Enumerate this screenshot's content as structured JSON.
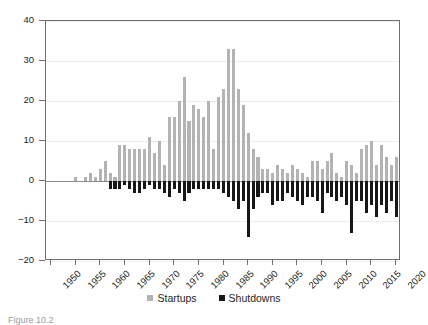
{
  "chart_data": {
    "type": "bar",
    "title": "",
    "xlabel": "",
    "ylabel": "",
    "ylim": [
      -20,
      40
    ],
    "yticks": [
      40,
      30,
      20,
      10,
      0,
      -10,
      -20
    ],
    "ytick_labels": [
      "40",
      "30",
      "20",
      "10",
      "0",
      "−10",
      "−20"
    ],
    "xlim": [
      1949,
      2021
    ],
    "xticks": [
      1950,
      1955,
      1960,
      1965,
      1970,
      1975,
      1980,
      1985,
      1990,
      1995,
      2000,
      2005,
      2010,
      2015,
      2020
    ],
    "xtick_labels": [
      "1950",
      "1955",
      "1960",
      "1965",
      "1970",
      "1975",
      "1980",
      "1985",
      "1990",
      "1995",
      "2000",
      "2005",
      "2010",
      "2015",
      "2020"
    ],
    "grid": true,
    "grid_axis": "y",
    "legend_position": "bottom-center",
    "stacked": false,
    "orientation": "vertical",
    "x": [
      1950,
      1951,
      1952,
      1953,
      1954,
      1955,
      1956,
      1957,
      1958,
      1959,
      1960,
      1961,
      1962,
      1963,
      1964,
      1965,
      1966,
      1967,
      1968,
      1969,
      1970,
      1971,
      1972,
      1973,
      1974,
      1975,
      1976,
      1977,
      1978,
      1979,
      1980,
      1981,
      1982,
      1983,
      1984,
      1985,
      1986,
      1987,
      1988,
      1989,
      1990,
      1991,
      1992,
      1993,
      1994,
      1995,
      1996,
      1997,
      1998,
      1999,
      2000,
      2001,
      2002,
      2003,
      2004,
      2005,
      2006,
      2007,
      2008,
      2009,
      2010,
      2011,
      2012,
      2013,
      2014,
      2015,
      2016,
      2017,
      2018,
      2019,
      2020
    ],
    "series": [
      {
        "name": "Startups",
        "color": "#b3b3b3",
        "values": [
          0,
          0,
          0,
          0,
          0,
          1,
          0,
          1,
          2,
          1,
          3,
          5,
          2,
          1,
          9,
          9,
          8,
          8,
          8,
          8,
          11,
          7,
          10,
          4,
          16,
          16,
          20,
          26,
          15,
          19,
          18,
          16,
          20,
          8,
          21,
          23,
          33,
          33,
          23,
          19,
          12,
          8,
          6,
          3,
          3,
          2,
          4,
          3,
          2,
          4,
          3,
          2,
          1,
          5,
          5,
          3,
          5,
          7,
          2,
          1,
          5,
          4,
          2,
          8,
          9,
          10,
          4,
          9,
          6,
          4,
          6
        ]
      },
      {
        "name": "Shutdowns",
        "color": "#171717",
        "values": [
          0,
          0,
          0,
          0,
          0,
          0,
          0,
          0,
          0,
          0,
          0,
          0,
          -2,
          -2,
          -2,
          -1,
          -2,
          -3,
          -3,
          -2,
          -1,
          -2,
          -2,
          -3,
          -4,
          -2,
          -3,
          -5,
          -3,
          -2,
          -2,
          -2,
          -2,
          -2,
          -2,
          -3,
          -4,
          -5,
          -7,
          -5,
          -14,
          -7,
          -4,
          -3,
          -3,
          -6,
          -5,
          -5,
          -3,
          -4,
          -5,
          -6,
          -4,
          -4,
          -5,
          -8,
          -3,
          -4,
          -5,
          -4,
          -6,
          -13,
          -5,
          -5,
          -8,
          -6,
          -9,
          -6,
          -8,
          -5,
          -9
        ]
      }
    ]
  },
  "legend": {
    "entries": [
      {
        "label": "Startups",
        "swatch": "startups-swatch"
      },
      {
        "label": "Shutdowns",
        "swatch": "shutdowns-swatch"
      }
    ]
  },
  "caption": {
    "text": "Figure 10.2"
  }
}
